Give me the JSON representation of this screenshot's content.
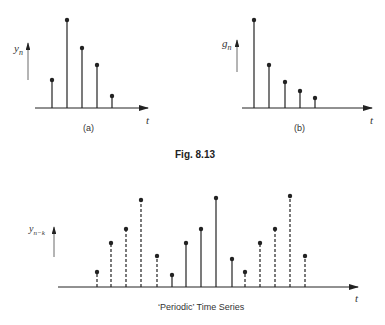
{
  "figure": {
    "caption": "Fig.  8.13",
    "bottom_caption": "‘Periodic’ Time Series"
  },
  "labels": {
    "a_y": "y",
    "a_y_sub": "n",
    "a_x": "t",
    "a_panel": "(a)",
    "b_y": "g",
    "b_y_sub": "n",
    "b_x": "t",
    "b_panel": "(b)",
    "c_y": "y",
    "c_y_sub": "n−k",
    "c_x": "t"
  },
  "colors": {
    "ink": "#222222",
    "background": "#ffffff"
  },
  "chart_data": [
    {
      "id": "a",
      "type": "stem",
      "title": "(a)",
      "ylabel": "y_n",
      "xlabel": "t",
      "baseline": 108,
      "x": [
        52,
        67,
        82,
        97,
        112
      ],
      "values": [
        28,
        88,
        60,
        43,
        12
      ],
      "styles": [
        "solid",
        "solid",
        "solid",
        "solid",
        "solid"
      ],
      "grid": false
    },
    {
      "id": "b",
      "type": "stem",
      "title": "(b)",
      "ylabel": "g_n",
      "xlabel": "t",
      "baseline": 108,
      "x": [
        254,
        269,
        285,
        300,
        315
      ],
      "values": [
        88,
        43,
        26,
        17,
        10
      ],
      "styles": [
        "solid",
        "solid",
        "solid",
        "solid",
        "solid"
      ],
      "grid": false
    },
    {
      "id": "periodic",
      "type": "stem",
      "title": "‘Periodic’ Time Series",
      "ylabel": "y_{n-k}",
      "xlabel": "t",
      "baseline": 287,
      "x": [
        97,
        111,
        126,
        141,
        157,
        172,
        186,
        201,
        216,
        232,
        245,
        260,
        275,
        290,
        305
      ],
      "values": [
        15,
        44,
        58,
        87,
        31,
        12,
        44,
        58,
        89,
        28,
        15,
        44,
        58,
        91,
        31
      ],
      "styles": [
        "dashed",
        "dashed",
        "dashed",
        "dashed",
        "dashed",
        "solid",
        "solid",
        "solid",
        "solid",
        "solid",
        "dashed",
        "dashed",
        "dashed",
        "dashed",
        "dashed"
      ],
      "grid": false
    }
  ]
}
